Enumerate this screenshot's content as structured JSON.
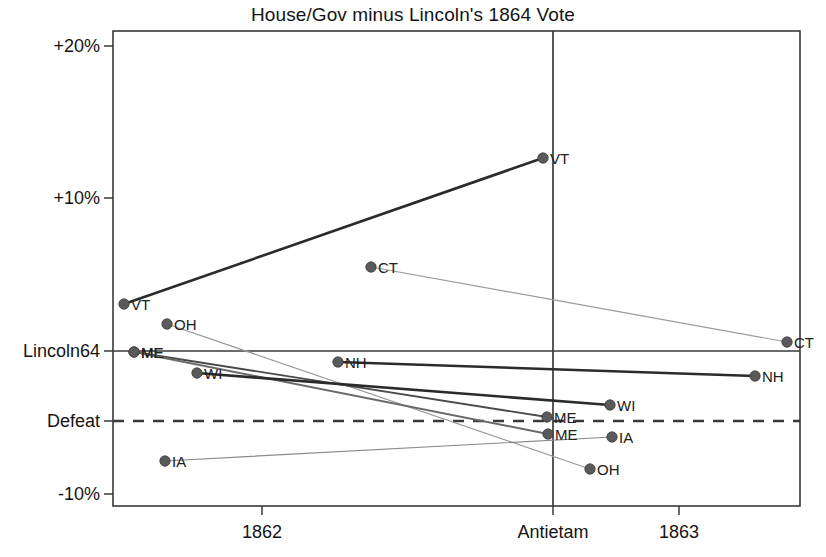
{
  "chart_data": {
    "type": "line",
    "title": "House/Gov minus Lincoln's 1864 Vote",
    "xlabel": "",
    "ylabel": "",
    "grid": false,
    "legend": null,
    "x_tick_labels": [
      "1862",
      "Antietam",
      "1863"
    ],
    "x_tick_positions_px": [
      262,
      553,
      679
    ],
    "y_tick_labels": [
      "+20%",
      "+10%",
      "Lincoln64",
      "Defeat",
      "-10%"
    ],
    "y_tick_values": [
      20,
      10,
      0,
      -4.6,
      -10
    ],
    "ylim": [
      -10.9,
      21.0
    ],
    "reference_lines": [
      {
        "name": "lincoln64-line",
        "orientation": "horizontal",
        "value": 0,
        "style": "solid",
        "label": "Lincoln64"
      },
      {
        "name": "defeat-line",
        "orientation": "horizontal",
        "value": -4.6,
        "style": "dashed",
        "label": "Defeat"
      },
      {
        "name": "antietam-line",
        "orientation": "vertical",
        "value": "Antietam",
        "style": "solid",
        "label": "Antietam"
      }
    ],
    "series": [
      {
        "name": "VT",
        "color": "#2b2b2b",
        "weight": "heavy",
        "points": [
          {
            "x_px": 124,
            "y_px": 304,
            "value": 3.1,
            "label": "VT"
          },
          {
            "x_px": 543,
            "y_px": 158,
            "value": 12.7,
            "label": "VT"
          }
        ]
      },
      {
        "name": "OH",
        "color": "#9a9a9a",
        "weight": "light",
        "points": [
          {
            "x_px": 167,
            "y_px": 324,
            "value": 1.8,
            "label": "OH"
          },
          {
            "x_px": 590,
            "y_px": 469,
            "value": -7.8,
            "label": "OH"
          }
        ]
      },
      {
        "name": "ME",
        "color": "#4a4a4a",
        "weight": "medium",
        "points": [
          {
            "x_px": 134,
            "y_px": 352,
            "value": -0.1,
            "label": "ME"
          },
          {
            "x_px": 547,
            "y_px": 417,
            "value": -4.3,
            "label": "ME"
          }
        ]
      },
      {
        "name": "ME2",
        "color": "#6a6a6a",
        "weight": "medium",
        "points": [
          {
            "x_px": 134,
            "y_px": 352,
            "value": -0.1,
            "label": "ME"
          },
          {
            "x_px": 548,
            "y_px": 434,
            "value": -5.4,
            "label": "ME"
          }
        ]
      },
      {
        "name": "WI",
        "color": "#2b2b2b",
        "weight": "heavy",
        "points": [
          {
            "x_px": 197,
            "y_px": 373,
            "value": -1.4,
            "label": "WI"
          },
          {
            "x_px": 610,
            "y_px": 405,
            "value": -3.5,
            "label": "WI"
          }
        ]
      },
      {
        "name": "NH",
        "color": "#2b2b2b",
        "weight": "heavy",
        "points": [
          {
            "x_px": 338,
            "y_px": 362,
            "value": -0.7,
            "label": "NH"
          },
          {
            "x_px": 755,
            "y_px": 376,
            "value": -1.6,
            "label": "NH"
          }
        ]
      },
      {
        "name": "CT",
        "color": "#9a9a9a",
        "weight": "light",
        "points": [
          {
            "x_px": 371,
            "y_px": 267,
            "value": 5.5,
            "label": "CT"
          },
          {
            "x_px": 787,
            "y_px": 342,
            "value": 0.6,
            "label": "CT"
          }
        ]
      },
      {
        "name": "IA",
        "color": "#8a8a8a",
        "weight": "light",
        "points": [
          {
            "x_px": 165,
            "y_px": 461,
            "value": -7.2,
            "label": "IA"
          },
          {
            "x_px": 612,
            "y_px": 437,
            "value": -5.6,
            "label": "IA"
          }
        ]
      }
    ]
  },
  "colors": {
    "axis": "#3a3a3a",
    "text": "#141414",
    "heavy_series": "#2b2b2b",
    "light_series": "#9a9a9a",
    "marker": "#5a5a5a",
    "background": "#ffffff"
  },
  "plot_box_px": {
    "left": 113,
    "top": 31,
    "right": 800,
    "bottom": 506
  }
}
